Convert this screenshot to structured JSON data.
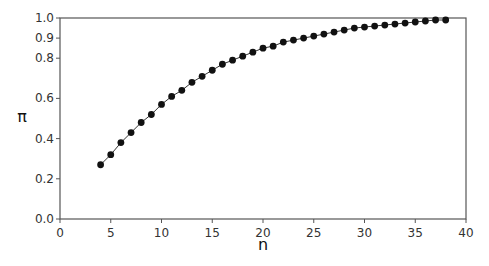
{
  "chart_data": {
    "type": "line",
    "title": "",
    "xlabel": "n",
    "ylabel": "π",
    "xlim": [
      0,
      40
    ],
    "ylim": [
      0.0,
      1.0
    ],
    "xticks": [
      0,
      5,
      10,
      15,
      20,
      25,
      30,
      35,
      40
    ],
    "xtick_labels": [
      "0",
      "5",
      "10",
      "15",
      "20",
      "25",
      "30",
      "35",
      "40"
    ],
    "yticks": [
      0.0,
      0.2,
      0.4,
      0.6,
      0.8,
      0.9,
      1.0
    ],
    "ytick_labels": [
      "0.0",
      "0.2",
      "0.4",
      "0.6",
      "0.8",
      "0.9",
      "1.0"
    ],
    "grid": false,
    "legend": null,
    "series": [
      {
        "name": "π",
        "marker": "filled-circle",
        "color": "#000000",
        "x": [
          4,
          5,
          6,
          7,
          8,
          9,
          10,
          11,
          12,
          13,
          14,
          15,
          16,
          17,
          18,
          19,
          20,
          21,
          22,
          23,
          24,
          25,
          26,
          27,
          28,
          29,
          30,
          31,
          32,
          33,
          34,
          35,
          36,
          37,
          38
        ],
        "y": [
          0.27,
          0.32,
          0.38,
          0.43,
          0.48,
          0.52,
          0.57,
          0.61,
          0.64,
          0.68,
          0.71,
          0.74,
          0.77,
          0.79,
          0.81,
          0.83,
          0.85,
          0.86,
          0.88,
          0.89,
          0.9,
          0.91,
          0.92,
          0.93,
          0.94,
          0.95,
          0.955,
          0.96,
          0.965,
          0.97,
          0.975,
          0.98,
          0.985,
          0.99,
          0.99
        ]
      }
    ]
  },
  "colors": {
    "axis": "#555555",
    "line": "#333333",
    "marker": "#111111"
  }
}
